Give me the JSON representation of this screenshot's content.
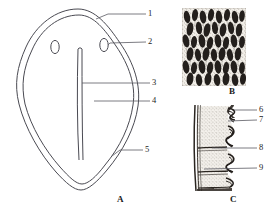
{
  "figure": {
    "background_color": "#ffffff",
    "line_color": "#4a4a52",
    "text_color": "#1c1c1c",
    "width": 273,
    "height": 213
  },
  "panels": [
    {
      "id": "A",
      "caption": "A",
      "description": "Outlined shield / leaf shaped organ in surface view with double contour, two small ovals near the top and a long vertical median slit",
      "caption_position": {
        "x": 117,
        "y": 195
      }
    },
    {
      "id": "B",
      "caption": "B",
      "description": "Dense dark stipple halftone of finger-like papillae / villi seen in surface magnification",
      "caption_position": {
        "x": 229,
        "y": 87
      }
    },
    {
      "id": "C",
      "caption": "C",
      "description": "Sectional halftone of a layered wall with stippled matrix and wavy dark inner folds",
      "caption_position": {
        "x": 230,
        "y": 195
      }
    }
  ],
  "callouts": [
    {
      "number": "1",
      "panel": "A",
      "label_x": 148,
      "label_y": 11,
      "leader_from_x": 146,
      "leader_from_y": 14,
      "leader_to_x": 108,
      "leader_to_y": 19
    },
    {
      "number": "2",
      "panel": "A",
      "label_x": 148,
      "label_y": 39,
      "leader_from_x": 146,
      "leader_from_y": 42,
      "leader_to_x": 110,
      "leader_to_y": 45
    },
    {
      "number": "3",
      "panel": "A",
      "label_x": 152,
      "label_y": 79,
      "leader_from_x": 150,
      "leader_from_y": 83,
      "leader_to_x": 82,
      "leader_to_y": 83
    },
    {
      "number": "4",
      "panel": "A",
      "label_x": 152,
      "label_y": 97,
      "leader_from_x": 150,
      "leader_from_y": 101,
      "leader_to_x": 94,
      "leader_to_y": 101
    },
    {
      "number": "5",
      "panel": "A",
      "label_x": 145,
      "label_y": 147,
      "leader_from_x": 143,
      "leader_from_y": 150,
      "leader_to_x": 116,
      "leader_to_y": 155
    },
    {
      "number": "6",
      "panel": "C",
      "label_x": 259,
      "label_y": 106,
      "leader_from_x": 257,
      "leader_from_y": 110,
      "leader_to_x": 234,
      "leader_to_y": 110
    },
    {
      "number": "7",
      "panel": "C",
      "label_x": 259,
      "label_y": 116,
      "leader_from_x": 257,
      "leader_from_y": 120,
      "leader_to_x": 228,
      "leader_to_y": 121
    },
    {
      "number": "8",
      "panel": "C",
      "label_x": 259,
      "label_y": 144,
      "leader_from_x": 257,
      "leader_from_y": 148,
      "leader_to_x": 214,
      "leader_to_y": 148
    },
    {
      "number": "9",
      "panel": "C",
      "label_x": 259,
      "label_y": 164,
      "leader_from_x": 257,
      "leader_from_y": 168,
      "leader_to_x": 206,
      "leader_to_y": 169
    }
  ]
}
